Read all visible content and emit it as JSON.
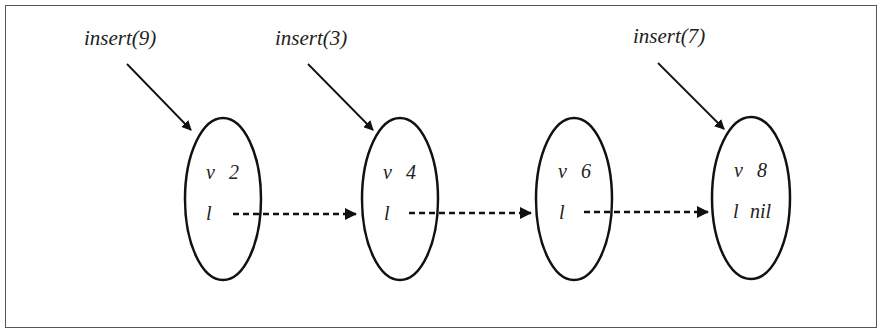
{
  "diagram": {
    "type": "linked-list",
    "operations": [
      {
        "label": "insert(9)",
        "target_node": 0
      },
      {
        "label": "insert(3)",
        "target_node": 1
      },
      {
        "label": "insert(7)",
        "target_node": 3
      }
    ],
    "nodes": [
      {
        "value_key": "v",
        "value": "2",
        "link_key": "l",
        "link": ""
      },
      {
        "value_key": "v",
        "value": "4",
        "link_key": "l",
        "link": ""
      },
      {
        "value_key": "v",
        "value": "6",
        "link_key": "l",
        "link": ""
      },
      {
        "value_key": "v",
        "value": "8",
        "link_key": "l",
        "link": "nil"
      }
    ],
    "edges": [
      {
        "from": 0,
        "to": 1,
        "style": "dashed"
      },
      {
        "from": 1,
        "to": 2,
        "style": "dashed"
      },
      {
        "from": 2,
        "to": 3,
        "style": "dashed"
      }
    ],
    "colors": {
      "stroke": "#111111",
      "frame": "#555555",
      "background": "#ffffff"
    }
  }
}
